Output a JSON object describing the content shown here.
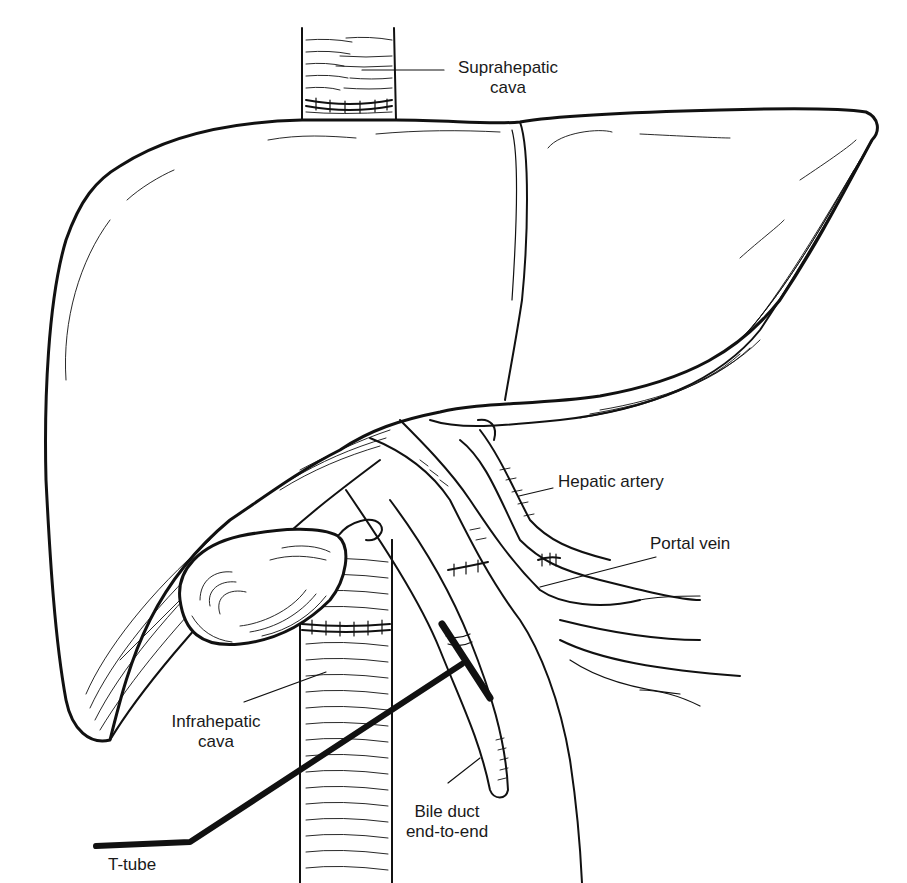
{
  "figure": {
    "ink_color": "#111111",
    "background": "#ffffff"
  },
  "labels": {
    "suprahepatic_cava": {
      "line1": "Suprahepatic",
      "line2": "cava"
    },
    "hepatic_artery": {
      "line1": "Hepatic artery"
    },
    "portal_vein": {
      "line1": "Portal vein"
    },
    "infrahepatic_cava": {
      "line1": "Infrahepatic",
      "line2": "cava"
    },
    "bile_duct": {
      "line1": "Bile duct",
      "line2": "end-to-end"
    },
    "t_tube": {
      "line1": "T-tube"
    }
  }
}
